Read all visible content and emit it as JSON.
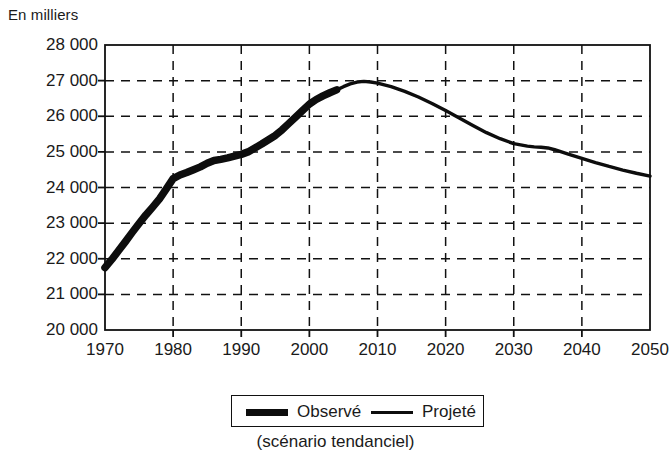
{
  "chart_data": {
    "type": "line",
    "title": "",
    "ylabel": "En milliers",
    "xlabel": "",
    "caption": "(scénario tendanciel)",
    "xlim": [
      1970,
      2050
    ],
    "ylim": [
      20000,
      28000
    ],
    "grid": true,
    "ytick_labels": [
      "28 000",
      "27 000",
      "26 000",
      "25 000",
      "24 000",
      "23 000",
      "22 000",
      "21 000",
      "20 000"
    ],
    "ytick_values": [
      28000,
      27000,
      26000,
      25000,
      24000,
      23000,
      22000,
      21000,
      20000
    ],
    "xtick_labels": [
      "1970",
      "1980",
      "1990",
      "2000",
      "2010",
      "2020",
      "2030",
      "2040",
      "2050"
    ],
    "xtick_values": [
      1970,
      1980,
      1990,
      2000,
      2010,
      2020,
      2030,
      2040,
      2050
    ],
    "legend_position": "bottom-center",
    "series": [
      {
        "name": "Observé",
        "style": "thick",
        "x": [
          1970,
          1971,
          1972,
          1973,
          1974,
          1975,
          1976,
          1977,
          1978,
          1979,
          1980,
          1981,
          1982,
          1983,
          1984,
          1985,
          1986,
          1987,
          1988,
          1989,
          1990,
          1991,
          1992,
          1993,
          1994,
          1995,
          1996,
          1997,
          1998,
          1999,
          2000,
          2001,
          2002,
          2003,
          2004
        ],
        "values": [
          21750,
          21980,
          22230,
          22480,
          22740,
          22990,
          23230,
          23450,
          23680,
          23960,
          24250,
          24350,
          24420,
          24500,
          24580,
          24680,
          24760,
          24790,
          24830,
          24880,
          24930,
          25000,
          25110,
          25220,
          25340,
          25460,
          25620,
          25800,
          25980,
          26160,
          26340,
          26470,
          26570,
          26660,
          26740
        ]
      },
      {
        "name": "Projeté",
        "style": "thin",
        "x": [
          2004,
          2005,
          2006,
          2007,
          2008,
          2009,
          2010,
          2012,
          2014,
          2016,
          2018,
          2020,
          2022,
          2024,
          2026,
          2028,
          2030,
          2032,
          2033,
          2034,
          2035,
          2036,
          2038,
          2040,
          2042,
          2044,
          2046,
          2048,
          2050
        ],
        "values": [
          26740,
          26830,
          26910,
          26960,
          26980,
          26960,
          26930,
          26830,
          26700,
          26540,
          26360,
          26160,
          25950,
          25740,
          25540,
          25370,
          25230,
          25160,
          25140,
          25130,
          25110,
          25060,
          24940,
          24820,
          24700,
          24590,
          24490,
          24400,
          24320
        ]
      }
    ]
  },
  "legend": {
    "observed_label": "Observé",
    "projected_label": "Projeté"
  }
}
